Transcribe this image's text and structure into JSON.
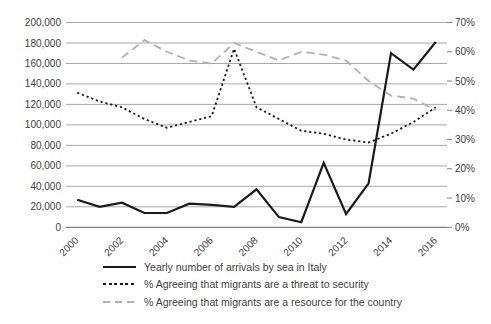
{
  "chart_data": {
    "type": "line",
    "title": "",
    "xlabel": "",
    "ylabel_left": "",
    "ylabel_right": "",
    "grid": true,
    "legend_position": "bottom",
    "x": [
      2000,
      2001,
      2002,
      2003,
      2004,
      2005,
      2006,
      2007,
      2008,
      2009,
      2010,
      2011,
      2012,
      2013,
      2014,
      2015,
      2016
    ],
    "x_tick_labels": [
      "2000",
      "2002",
      "2004",
      "2006",
      "2008",
      "2010",
      "2012",
      "2014",
      "2016"
    ],
    "left_axis": {
      "min": 0,
      "max": 200000,
      "step": 20000,
      "tick_labels": [
        "0",
        "20,000",
        "40,000",
        "60,000",
        "80,000",
        "100,000",
        "120,000",
        "140,000",
        "160,000",
        "180,000",
        "200,000"
      ]
    },
    "right_axis": {
      "min": 0,
      "max": 70,
      "step": 10,
      "tick_labels": [
        "0%",
        "10%",
        "20%",
        "30%",
        "40%",
        "50%",
        "60%",
        "70%"
      ]
    },
    "series": [
      {
        "name": "Yearly number of arrivals by sea in Italy",
        "axis": "left",
        "style": "solid",
        "color": "#1a1a1a",
        "values": [
          27000,
          20000,
          24000,
          14000,
          14000,
          23000,
          22000,
          20000,
          37000,
          10000,
          5000,
          63000,
          13000,
          43000,
          170000,
          154000,
          181000
        ]
      },
      {
        "name": "% Agreeing that migrants are a threat to security",
        "axis": "right",
        "style": "dotted",
        "color": "#1a1a1a",
        "values": [
          46,
          43,
          41,
          37,
          34,
          36,
          38,
          61,
          41,
          37,
          33,
          32,
          30,
          29,
          32,
          36,
          41
        ]
      },
      {
        "name": "% Agreeing that migrants are a resource for the country",
        "axis": "right",
        "style": "dashed",
        "color": "#b0b0b0",
        "values": [
          null,
          null,
          58,
          64,
          60,
          57,
          56,
          63,
          60,
          57,
          60,
          59,
          57,
          50,
          45,
          44,
          40
        ]
      }
    ],
    "colors": {
      "gridline": "#a8a8a8",
      "axis_line": "#808080",
      "text": "#404040"
    }
  }
}
